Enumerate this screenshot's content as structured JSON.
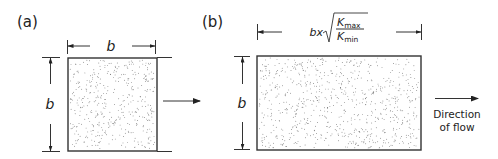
{
  "figure": {
    "panel_a": {
      "label": "(a)",
      "width_label": "b",
      "height_label": "b"
    },
    "panel_b": {
      "label": "(b)",
      "width_label": {
        "prefix": "bx",
        "numerator": "K",
        "numerator_sub": "max",
        "denominator": "K",
        "denominator_sub": "min"
      },
      "height_label": "b"
    },
    "flow_caption_line1": "Direction",
    "flow_caption_line2": "of flow",
    "colors": {
      "line": "#333333",
      "stipple": "#555555",
      "background": "#ffffff"
    }
  }
}
